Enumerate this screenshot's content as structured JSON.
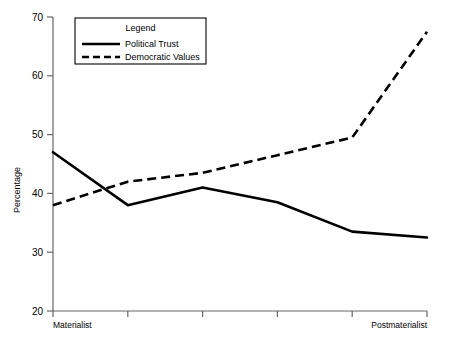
{
  "chart_data": {
    "type": "line",
    "title": "",
    "xlabel": "",
    "ylabel": "Percentage",
    "ylim": [
      20,
      70
    ],
    "yticks": [
      20,
      30,
      40,
      50,
      60,
      70
    ],
    "ytick_labels": [
      "20",
      "30",
      "40",
      "50",
      "60",
      "70"
    ],
    "grid": false,
    "legend_position": "top-left",
    "legend_title": "Legend",
    "categories": [
      "Materialist",
      "",
      "",
      "",
      "",
      "Postmaterialist"
    ],
    "xtick_labels_shown": [
      "Materialist",
      "Postmaterialist"
    ],
    "x_axis_left_label": "Materialist",
    "x_axis_right_label": "Postmaterialist",
    "series": [
      {
        "name": "Political Trust",
        "style": "solid",
        "color": "#000000",
        "values": [
          47.0,
          38.0,
          41.0,
          38.5,
          33.5,
          32.5
        ]
      },
      {
        "name": "Democratic Values",
        "style": "dashed",
        "color": "#000000",
        "values": [
          38.0,
          42.0,
          43.5,
          46.5,
          49.5,
          67.5
        ]
      }
    ]
  },
  "axis": {
    "y_title": "Percentage"
  },
  "legend": {
    "title": "Legend",
    "entries": [
      {
        "label": "Political Trust",
        "style": "solid"
      },
      {
        "label": "Democratic Values",
        "style": "dashed"
      }
    ]
  },
  "colors": {
    "axis": "#555555",
    "series": "#000000",
    "background": "#ffffff",
    "legend_border": "#000000"
  }
}
